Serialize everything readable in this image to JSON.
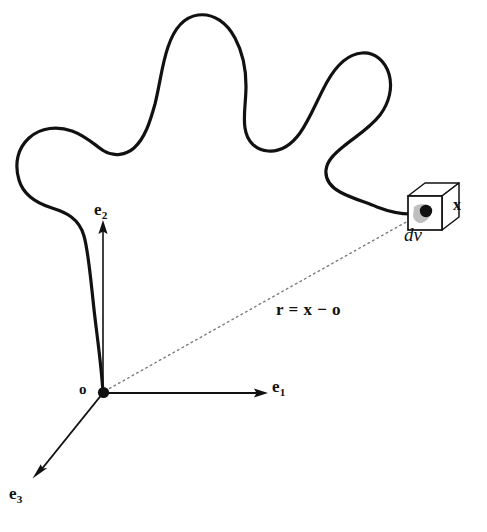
{
  "figure": {
    "name": "continuum-body-position-vector-diagram",
    "background_color": "#ffffff",
    "ink_color": "#111111",
    "dotted_color": "#808080"
  },
  "labels": {
    "basis_e1": {
      "symbol": "e",
      "subscript": "1"
    },
    "basis_e2": {
      "symbol": "e",
      "subscript": "2"
    },
    "basis_e3": {
      "symbol": "e",
      "subscript": "3"
    },
    "origin": "o",
    "point_x": "x",
    "volume_element": "dv",
    "position_vector": "r = x − o"
  },
  "geometry": {
    "origin_point": {
      "x": 103,
      "y": 393
    },
    "point_x": {
      "x": 426,
      "y": 211
    },
    "e1_arrow_tip": {
      "x": 266,
      "y": 393
    },
    "e2_arrow_tip": {
      "x": 103,
      "y": 222
    },
    "e3_arrow_tip": {
      "x": 33,
      "y": 477
    },
    "cube_front_face": {
      "x": 408,
      "y": 196,
      "width": 34,
      "height": 34
    },
    "cube_depth": {
      "dx": 17,
      "dy": -13
    }
  }
}
